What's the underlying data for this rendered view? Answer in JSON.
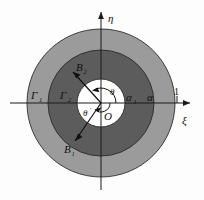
{
  "figure": {
    "background_color": "#fdfdfd",
    "colors": {
      "outer_annulus": "#9a9a9a",
      "inner_annulus": "#5e5e5e",
      "inner_disc": "#ffffff",
      "stroke": "#1a1a1a",
      "axis": "#1a1a1a"
    }
  },
  "axes": {
    "horizontal_label": "ξ",
    "vertical_label": "η",
    "origin_label": "O",
    "unit_tick_label": "1"
  },
  "regions": {
    "outer_boundary_label": "Γ",
    "outer_boundary_sub": "1",
    "inner_boundary_label": "Γ",
    "inner_boundary_sub": "2",
    "outer_radius_label": "α",
    "inner_radius_label": "α",
    "inner_radius_sub": "1"
  },
  "rays": {
    "upper_point_label": "B",
    "upper_point_sub": "2",
    "lower_point_label": "B",
    "lower_point_sub": "1"
  },
  "angles": {
    "upper_angle_label": "θ",
    "lower_angle_label": "θ",
    "lower_angle_prime": "′"
  },
  "geometry": {
    "center_x": 101,
    "center_y": 103,
    "outer_radius": 74,
    "middle_radius": 53,
    "inner_radius": 24,
    "x_axis_y": 103,
    "y_axis_x": 101,
    "unit_x": 180
  }
}
